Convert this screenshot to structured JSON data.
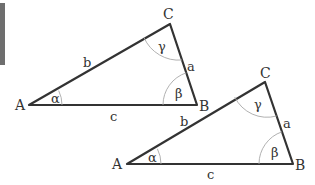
{
  "diagram": {
    "type": "two-triangles",
    "colors": {
      "edge": "#333333",
      "arc": "#a8a8a8",
      "label": "#333333",
      "side_bar": "#6e6e6e"
    },
    "triangles": [
      {
        "id": "triangle-1",
        "vertices": {
          "A": [
            29,
            105
          ],
          "B": [
            197,
            105
          ],
          "C": [
            170,
            24
          ]
        },
        "labels": {
          "A": "A",
          "B": "B",
          "C": "C",
          "a": "a",
          "b": "b",
          "c": "c",
          "alpha": "α",
          "beta": "β",
          "gamma": "γ"
        }
      },
      {
        "id": "triangle-2",
        "vertices": {
          "A": [
            127,
            164
          ],
          "B": [
            293,
            164
          ],
          "C": [
            265,
            82
          ]
        },
        "labels": {
          "A": "A",
          "B": "B",
          "C": "C",
          "a": "a",
          "b": "b",
          "c": "c",
          "alpha": "α",
          "beta": "β",
          "gamma": "γ"
        }
      }
    ]
  }
}
